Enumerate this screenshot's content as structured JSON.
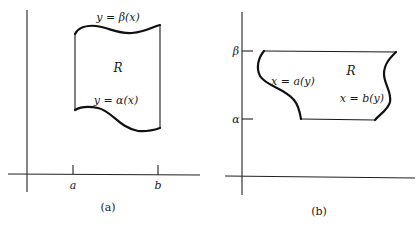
{
  "figure": {
    "panels": [
      {
        "id": "a",
        "caption": "(a)",
        "region_label": "R",
        "upper_boundary_label": "y = β(x)",
        "lower_boundary_label": "y = α(x)",
        "x_ticks": [
          "a",
          "b"
        ],
        "description": "Region R bounded vertically between curves y = α(x) and y = β(x) for a ≤ x ≤ b"
      },
      {
        "id": "b",
        "caption": "(b)",
        "region_label": "R",
        "left_boundary_label": "x = a(y)",
        "right_boundary_label": "x = b(y)",
        "y_ticks": [
          "β",
          "α"
        ],
        "description": "Region R bounded horizontally between curves x = a(y) and x = b(y) for α ≤ y ≤ β"
      }
    ]
  }
}
